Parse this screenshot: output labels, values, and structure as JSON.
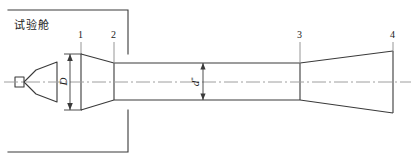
{
  "figure": {
    "type": "engineering-schematic",
    "width": 415,
    "height": 165,
    "background_color": "#ffffff",
    "line_color": "#333333",
    "centerline_color": "#9a9a9a"
  },
  "labels": {
    "chamber": "试验舱",
    "station_1": "1",
    "station_2": "2",
    "station_3": "3",
    "station_4": "4",
    "diameter_big": "D",
    "throat_symbol": "d",
    "throat_superscript": "*"
  },
  "geometry": {
    "chamber_box": {
      "left": 8,
      "top": 10,
      "right": 128,
      "bottom": 152
    },
    "centerline_y": 82,
    "station_x": {
      "s1": 81,
      "s2": 114,
      "s3": 300,
      "s4": 393
    },
    "inlet_top_y": 54,
    "inlet_bottom_y": 110,
    "throat_top_y": 63,
    "throat_bottom_y": 100,
    "exit_top_y": 51,
    "exit_bottom_y": 113,
    "dim_D_span": {
      "top": 54,
      "bottom": 110,
      "x": 70
    },
    "dim_d_span": {
      "top": 63,
      "bottom": 100,
      "x": 203
    }
  }
}
